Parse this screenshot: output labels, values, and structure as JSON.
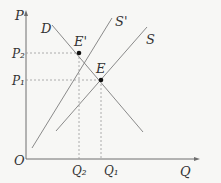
{
  "diagram": {
    "type": "supply-demand",
    "axes": {
      "y_label": "P",
      "x_label": "Q",
      "origin_label": "O"
    },
    "curves": [
      {
        "id": "D",
        "label": "D",
        "kind": "demand"
      },
      {
        "id": "S_prime",
        "label": "S'",
        "kind": "supply"
      },
      {
        "id": "S",
        "label": "S",
        "kind": "supply"
      }
    ],
    "points": [
      {
        "id": "E_prime",
        "label": "E'",
        "price": "P₂",
        "quantity": "Q₂"
      },
      {
        "id": "E",
        "label": "E",
        "price": "P₁",
        "quantity": "Q₁"
      }
    ],
    "tick_labels": {
      "P2": "P₂",
      "P1": "P₁",
      "Q2": "Q₂",
      "Q1": "Q₁"
    },
    "colors": {
      "line": "#8a8a8a",
      "axis": "#6e6e6e",
      "point": "#111111",
      "dash": "#9a9a9a"
    }
  }
}
